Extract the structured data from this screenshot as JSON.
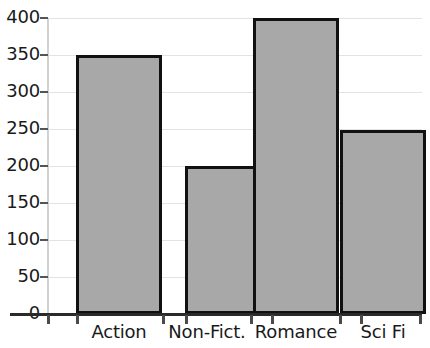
{
  "chart_data": {
    "type": "bar",
    "title": "",
    "subtitle": "",
    "xlabel": "",
    "ylabel": "",
    "categories": [
      "Action",
      "Non-Fict.",
      "Romance",
      "Sci Fi"
    ],
    "values": [
      350,
      200,
      400,
      248
    ],
    "series": [
      {
        "name": "",
        "values": [
          350,
          200,
          400,
          248
        ]
      }
    ],
    "ylim": [
      0,
      400
    ],
    "ytick_labels": [
      "400",
      "350",
      "300",
      "250",
      "200",
      "150",
      "100",
      "50",
      "0"
    ],
    "ytick_values": [
      400,
      350,
      300,
      250,
      200,
      150,
      100,
      50,
      0
    ],
    "grid": true,
    "grid_axis": "y",
    "legend": false,
    "legend_position": "none",
    "annotations": [],
    "colors": {
      "bar_fill": "#a8a8a8",
      "bar_edge": "#111111",
      "gridline": "#e3e3e3",
      "axis_line": "#2a2a2a",
      "tick_label": "#1a1a1a",
      "background": "#ffffff"
    }
  }
}
